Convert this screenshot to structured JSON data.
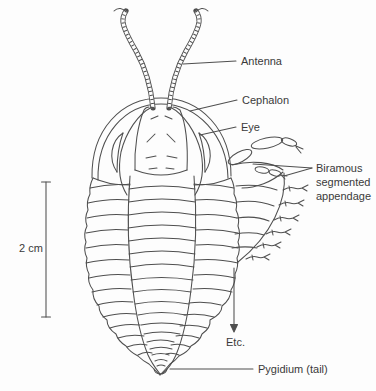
{
  "colors": {
    "line": "#4f4f4f",
    "text": "#3a3a3a",
    "background": "#fdfdfd"
  },
  "annotations": {
    "antenna": "Antenna",
    "cephalon": "Cephalon",
    "eye": "Eye",
    "biramous": [
      "Biramous",
      "segmented",
      "appendage"
    ],
    "etc": "Etc.",
    "pygidium": "Pygidium (tail)",
    "scale": "2 cm"
  }
}
